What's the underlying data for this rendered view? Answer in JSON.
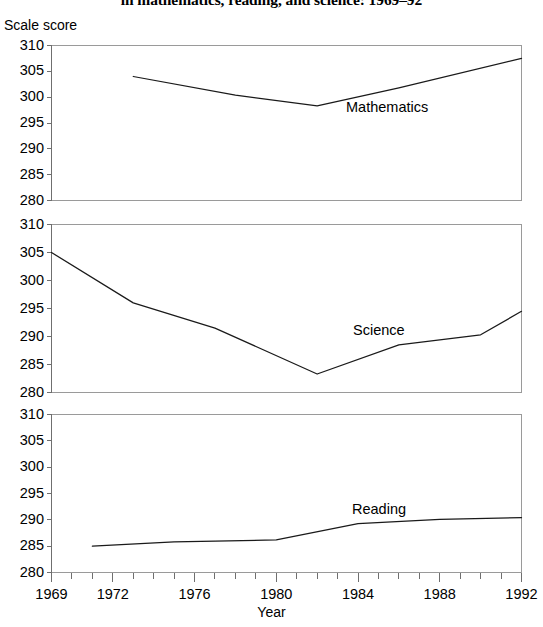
{
  "title": "in mathematics, reading, and science: 1969–92",
  "axis": {
    "ylabel": "Scale score",
    "xlabel": "Year"
  },
  "ytick_labels": [
    "310",
    "305",
    "300",
    "295",
    "290",
    "285",
    "280"
  ],
  "xtick_labels": [
    "1969",
    "1972",
    "1976",
    "1980",
    "1984",
    "1988",
    "1992"
  ],
  "series_labels": {
    "mathematics": "Mathematics",
    "science": "Science",
    "reading": "Reading"
  },
  "colors": {
    "line": "#1a1a1a",
    "frame": "#9a9a9a",
    "axis": "#6f6f6f",
    "background": "#ffffff"
  },
  "chart_data": [
    {
      "type": "line",
      "panel": 1,
      "title": "Mathematics",
      "xlabel": "Year",
      "ylabel": "Scale score",
      "xlim": [
        1969,
        1992
      ],
      "ylim": [
        280,
        310
      ],
      "yticks": [
        280,
        285,
        290,
        295,
        300,
        305,
        310
      ],
      "xticks": [
        1969,
        1972,
        1976,
        1980,
        1984,
        1988,
        1992
      ],
      "grid": false,
      "legend": "inline-label",
      "series": [
        {
          "name": "Mathematics",
          "x": [
            1973,
            1978,
            1982,
            1986,
            1992
          ],
          "values": [
            304.0,
            300.4,
            298.3,
            301.8,
            307.5
          ]
        }
      ]
    },
    {
      "type": "line",
      "panel": 2,
      "title": "Science",
      "xlabel": "Year",
      "ylabel": "Scale score",
      "xlim": [
        1969,
        1992
      ],
      "ylim": [
        280,
        310
      ],
      "yticks": [
        280,
        285,
        290,
        295,
        300,
        305,
        310
      ],
      "xticks": [
        1969,
        1972,
        1976,
        1980,
        1984,
        1988,
        1992
      ],
      "grid": false,
      "legend": "inline-label",
      "series": [
        {
          "name": "Science",
          "x": [
            1969,
            1973,
            1977,
            1982,
            1986,
            1990,
            1992
          ],
          "values": [
            305.0,
            296.0,
            291.5,
            283.3,
            288.5,
            290.3,
            294.5
          ]
        }
      ]
    },
    {
      "type": "line",
      "panel": 3,
      "title": "Reading",
      "xlabel": "Year",
      "ylabel": "Scale score",
      "xlim": [
        1969,
        1992
      ],
      "ylim": [
        280,
        310
      ],
      "yticks": [
        280,
        285,
        290,
        295,
        300,
        305,
        310
      ],
      "xticks": [
        1969,
        1972,
        1976,
        1980,
        1984,
        1988,
        1992
      ],
      "grid": false,
      "legend": "inline-label",
      "series": [
        {
          "name": "Reading",
          "x": [
            1971,
            1975,
            1980,
            1984,
            1988,
            1992
          ],
          "values": [
            285.0,
            285.8,
            286.2,
            289.3,
            290.1,
            290.4
          ]
        }
      ]
    }
  ]
}
